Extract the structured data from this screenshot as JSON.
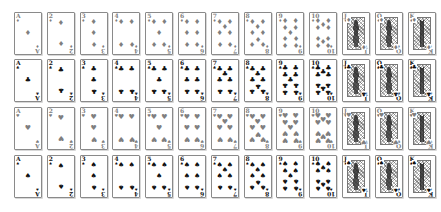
{
  "ranks": [
    "A",
    "2",
    "3",
    "4",
    "5",
    "6",
    "7",
    "8",
    "9",
    "10",
    "J",
    "Q",
    "K"
  ],
  "rows": [
    {
      "suit": "diamonds",
      "symbol": "♦",
      "tone": "light"
    },
    {
      "suit": "clubs",
      "symbol": "♣",
      "tone": "dark"
    },
    {
      "suit": "hearts",
      "symbol": "♥",
      "tone": "light"
    },
    {
      "suit": "spades",
      "symbol": "♠",
      "tone": "dark"
    }
  ],
  "colors": {
    "light_suit": "#7f7f7f",
    "dark_suit": "#111111",
    "border": "#8a8a8a"
  }
}
